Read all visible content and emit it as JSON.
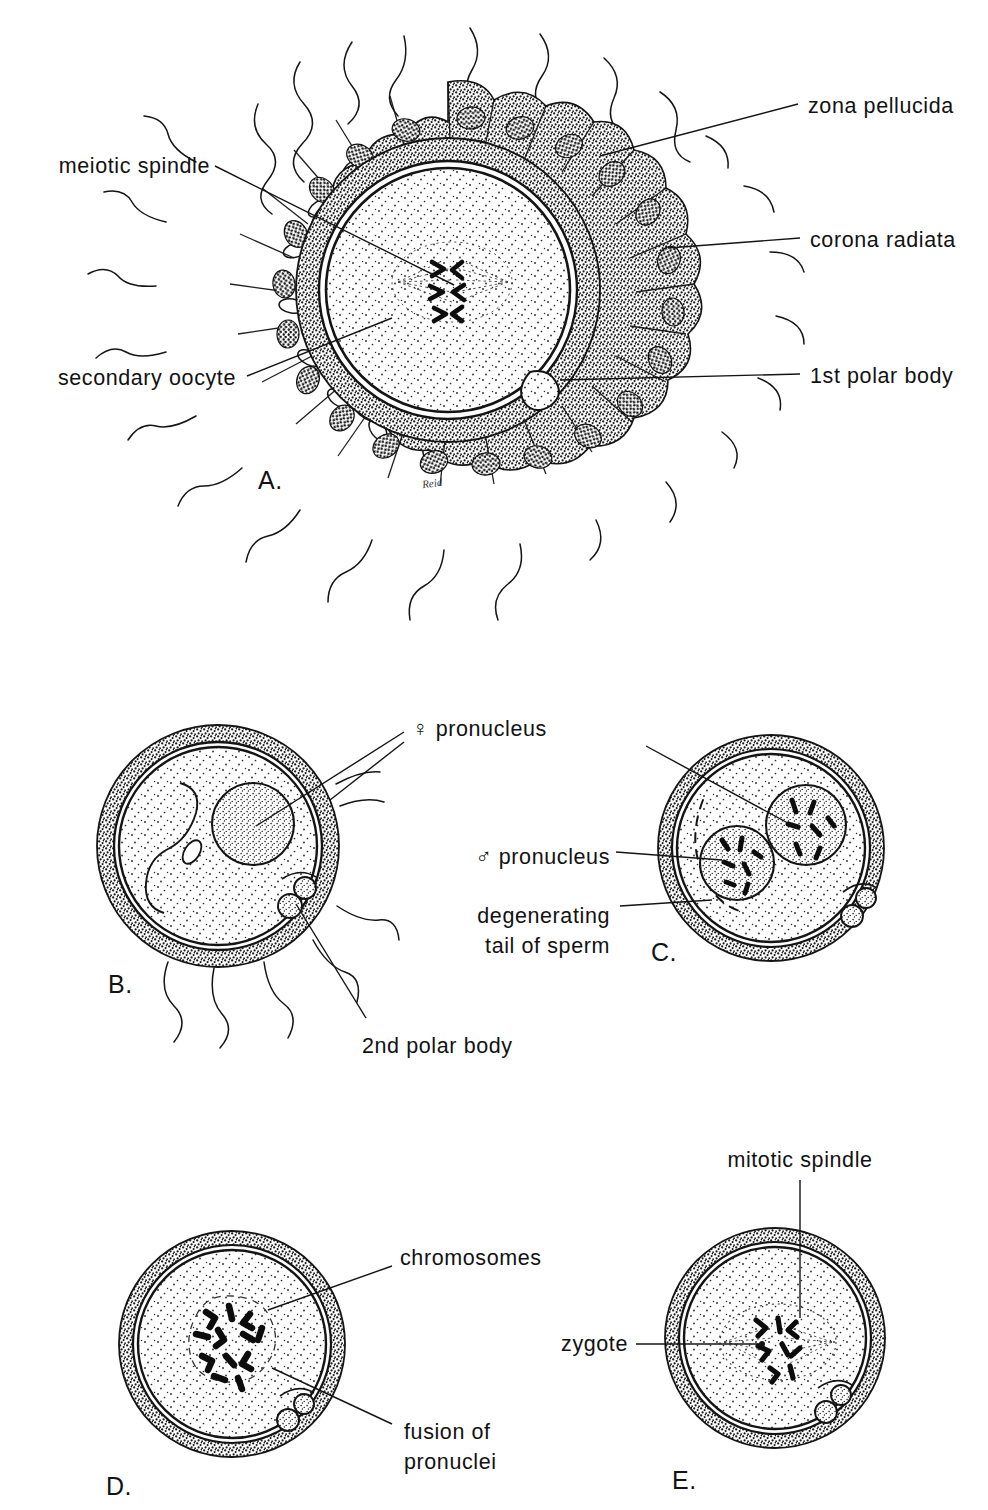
{
  "figure": {
    "artist_signature": "Reid",
    "ink_color": "#111111",
    "background_color": "#ffffff"
  },
  "panels": [
    {
      "id": "A",
      "letter": "A.",
      "caption": "Secondary oocyte surrounded by corona radiata and many sperms",
      "labels": [
        {
          "name": "meiotic-spindle",
          "text": "meiotic spindle",
          "align": "right"
        },
        {
          "name": "secondary-oocyte",
          "text": "secondary oocyte",
          "align": "right"
        },
        {
          "name": "zona-pellucida",
          "text": "zona pellucida",
          "align": "left"
        },
        {
          "name": "corona-radiata",
          "text": "corona radiata",
          "align": "left"
        },
        {
          "name": "first-polar-body",
          "text": "1st polar body",
          "align": "left"
        }
      ]
    },
    {
      "id": "B",
      "letter": "B.",
      "caption": "Sperm has entered the oocyte; female pronucleus formed, 2nd polar body extruded",
      "labels": [
        {
          "name": "female-pronucleus",
          "symbol": "♀",
          "text": " pronucleus",
          "align": "left"
        },
        {
          "name": "second-polar-body",
          "text": "2nd polar body",
          "align": "left"
        }
      ]
    },
    {
      "id": "C",
      "letter": "C.",
      "caption": "Male and female pronuclei approach each other; sperm tail degenerating",
      "labels": [
        {
          "name": "male-pronucleus",
          "symbol": "♂",
          "text": " pronucleus",
          "align": "right"
        },
        {
          "name": "degenerating-tail-of-sperm",
          "text": "degenerating",
          "text2": "tail of sperm",
          "align": "right"
        }
      ]
    },
    {
      "id": "D",
      "letter": "D.",
      "caption": "Pronuclei fusing; chromosomes intermingle",
      "labels": [
        {
          "name": "chromosomes",
          "text": "chromosomes",
          "align": "left"
        },
        {
          "name": "fusion-of-pronuclei",
          "text": "fusion of",
          "text2": "pronuclei",
          "align": "left"
        }
      ]
    },
    {
      "id": "E",
      "letter": "E.",
      "caption": "Zygote with chromosomes on the mitotic spindle",
      "labels": [
        {
          "name": "mitotic-spindle",
          "text": "mitotic spindle",
          "align": "center"
        },
        {
          "name": "zygote",
          "text": "zygote",
          "align": "right"
        }
      ]
    }
  ],
  "labels_flat": {
    "meiotic_spindle": "meiotic spindle",
    "secondary_oocyte": "secondary oocyte",
    "zona_pellucida": "zona pellucida",
    "corona_radiata": "corona radiata",
    "first_polar_body": "1st polar body",
    "female_pronucleus_symbol": "♀",
    "female_pronucleus_text": " pronucleus",
    "male_pronucleus_symbol": "♂",
    "male_pronucleus_text": " pronucleus",
    "degenerating_line1": "degenerating",
    "degenerating_line2": "tail of sperm",
    "second_polar_body": "2nd polar body",
    "chromosomes": "chromosomes",
    "fusion_line1": "fusion of",
    "fusion_line2": "pronuclei",
    "mitotic_spindle": "mitotic spindle",
    "zygote": "zygote",
    "letter_a": "A.",
    "letter_b": "B.",
    "letter_c": "C.",
    "letter_d": "D.",
    "letter_e": "E.",
    "signature": "Reid"
  }
}
